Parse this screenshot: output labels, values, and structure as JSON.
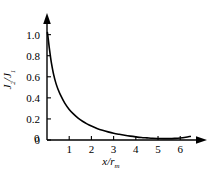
{
  "chart_data": {
    "type": "line",
    "title": "",
    "subtitle": "",
    "xlabel": "x/r_m",
    "ylabel": "J_2/J_1",
    "xlabel_parts": {
      "numerator": "x",
      "denominator": "r",
      "denominator_sub": "m"
    },
    "ylabel_parts": {
      "numerator": "J",
      "numerator_sub": "2",
      "denominator": "J",
      "denominator_sub": "1"
    },
    "xlim": [
      0,
      6.8
    ],
    "ylim": [
      0,
      1.12
    ],
    "xticks": [
      0,
      1,
      2,
      3,
      4,
      5,
      6
    ],
    "xticklabels": [
      "0",
      "1",
      "2",
      "3",
      "4",
      "5",
      "6"
    ],
    "yticks": [
      0,
      0.2,
      0.4,
      0.6,
      0.8,
      1.0
    ],
    "yticklabels": [
      "0",
      "0.2",
      "0.4",
      "0.6",
      "0.8",
      "1.0"
    ],
    "grid": false,
    "legend": false,
    "legend_position": "none",
    "axis_style": "arrow-terminated-spines",
    "series": [
      {
        "name": "J2/J1 decay",
        "color": "#000000",
        "linewidth": 1.6,
        "x": [
          0.02,
          0.05,
          0.1,
          0.15,
          0.2,
          0.3,
          0.4,
          0.5,
          0.6,
          0.8,
          1.0,
          1.2,
          1.4,
          1.6,
          1.8,
          2.0,
          2.25,
          2.5,
          2.75,
          3.0,
          3.25,
          3.5,
          3.75,
          4.0,
          4.25,
          4.5,
          4.75,
          5.0,
          5.25,
          5.5,
          5.75,
          6.0,
          6.25,
          6.45
        ],
        "y": [
          1.02,
          0.97,
          0.88,
          0.8,
          0.73,
          0.62,
          0.54,
          0.48,
          0.43,
          0.35,
          0.29,
          0.245,
          0.208,
          0.178,
          0.153,
          0.132,
          0.11,
          0.092,
          0.077,
          0.064,
          0.054,
          0.045,
          0.037,
          0.03,
          0.024,
          0.02,
          0.016,
          0.014,
          0.013,
          0.013,
          0.015,
          0.019,
          0.026,
          0.034
        ]
      }
    ],
    "annotations": []
  },
  "colors": {
    "background": "#ffffff",
    "axis": "#000000",
    "curve": "#000000",
    "text": "#000000"
  }
}
